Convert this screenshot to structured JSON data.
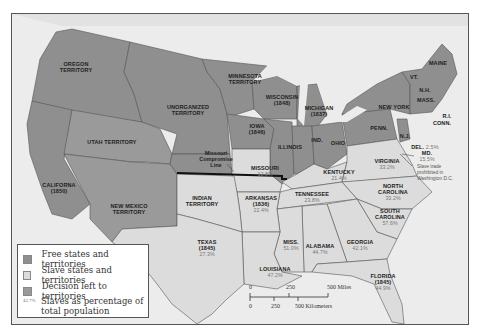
{
  "map": {
    "colors": {
      "free": "#8f8f8f",
      "slave": "#dcdcdc",
      "decision": "#9a9a9a",
      "water": "#e8e8e8",
      "border": "#555555",
      "compromise_line": "#111111"
    },
    "regions": [
      {
        "id": "oregon",
        "name": "OREGON\nTERRITORY",
        "status": "free"
      },
      {
        "id": "minnesota",
        "name": "MINNESOTA\nTERRITORY",
        "status": "free"
      },
      {
        "id": "unorganized",
        "name": "UNORGANIZED\nTERRITORY",
        "status": "free"
      },
      {
        "id": "utah",
        "name": "UTAH TERRITORY",
        "status": "decision"
      },
      {
        "id": "california",
        "name": "CALIFORNA\n(1850)",
        "status": "free"
      },
      {
        "id": "new_mexico",
        "name": "NEW MEXICO\nTERRITORY",
        "status": "decision"
      },
      {
        "id": "wisconsin",
        "name": "WISCONSIN\n(1848)",
        "status": "free"
      },
      {
        "id": "michigan",
        "name": "MICHIGAN\n(1837)",
        "status": "free"
      },
      {
        "id": "iowa",
        "name": "IOWA\n(1846)",
        "status": "free"
      },
      {
        "id": "illinois",
        "name": "ILLINOIS",
        "status": "free"
      },
      {
        "id": "indiana",
        "name": "IND.",
        "status": "free"
      },
      {
        "id": "ohio",
        "name": "OHIO",
        "status": "free"
      },
      {
        "id": "penn",
        "name": "PENN.",
        "status": "free"
      },
      {
        "id": "new_york",
        "name": "NEW YORK",
        "status": "free"
      },
      {
        "id": "vermont",
        "name": "VT.",
        "status": "free"
      },
      {
        "id": "nh",
        "name": "N.H.",
        "status": "free"
      },
      {
        "id": "maine",
        "name": "MAINE",
        "status": "free"
      },
      {
        "id": "mass",
        "name": "MASS.",
        "status": "free"
      },
      {
        "id": "ri",
        "name": "R.I.",
        "status": "free"
      },
      {
        "id": "conn",
        "name": "CONN.",
        "status": "free"
      },
      {
        "id": "nj",
        "name": "N.J.",
        "status": "free"
      },
      {
        "id": "missouri",
        "name": "MISSOURI",
        "pct": "12.8%",
        "status": "slave"
      },
      {
        "id": "kentucky",
        "name": "KENTUCKY",
        "pct": "21.4%",
        "status": "slave"
      },
      {
        "id": "virginia",
        "name": "VIRGINIA",
        "pct": "33.2%",
        "status": "slave"
      },
      {
        "id": "delaware",
        "name": "DEL.",
        "pct": "2.5%",
        "status": "slave"
      },
      {
        "id": "maryland",
        "name": "MD.",
        "pct": "15.5%",
        "status": "slave"
      },
      {
        "id": "north_carolina",
        "name": "NORTH\nCAROLINA",
        "pct": "33.2%",
        "status": "slave"
      },
      {
        "id": "tennessee",
        "name": "TENNESSEE",
        "pct": "23.8%",
        "status": "slave"
      },
      {
        "id": "arkansas",
        "name": "ARKANSAS\n(1836)",
        "pct": "22.4%",
        "status": "slave"
      },
      {
        "id": "indian",
        "name": "INDIAN\nTERRITORY",
        "status": "slave"
      },
      {
        "id": "south_carolina",
        "name": "SOUTH\nCAROLINA",
        "pct": "57.6%",
        "status": "slave"
      },
      {
        "id": "georgia",
        "name": "GEORGIA",
        "pct": "42.1%",
        "status": "slave"
      },
      {
        "id": "alabama",
        "name": "ALABAMA",
        "pct": "44.7%",
        "status": "slave"
      },
      {
        "id": "mississippi",
        "name": "MISS.",
        "pct": "51.0%",
        "status": "slave"
      },
      {
        "id": "louisiana",
        "name": "LOUISIANA",
        "pct": "47.2%",
        "status": "slave"
      },
      {
        "id": "texas",
        "name": "TEXAS\n(1845)",
        "pct": "27.3%",
        "status": "slave"
      },
      {
        "id": "florida",
        "name": "FLORIDA\n(1845)",
        "pct": "44.9%",
        "status": "slave"
      }
    ],
    "missouri_compromise_label": "Missouri\nCompromise\nLine",
    "dc_note": "Slave trade\nprohibited in\nWashington D.C."
  },
  "legend": {
    "items": [
      {
        "label": "Free states and territories",
        "swatch": "#8f8f8f"
      },
      {
        "label": "Slave states and territories",
        "swatch": "#dcdcdc"
      },
      {
        "label": "Decision left to territories",
        "swatch": "#9a9a9a"
      }
    ],
    "pct_example": "42.7%",
    "pct_label_1": "Slaves as percentage of",
    "pct_label_2": "total population"
  },
  "scale": {
    "miles_ticks": [
      "0",
      "250",
      "500 Miles"
    ],
    "km_ticks": [
      "0",
      "250",
      "500 Kilometers"
    ]
  }
}
